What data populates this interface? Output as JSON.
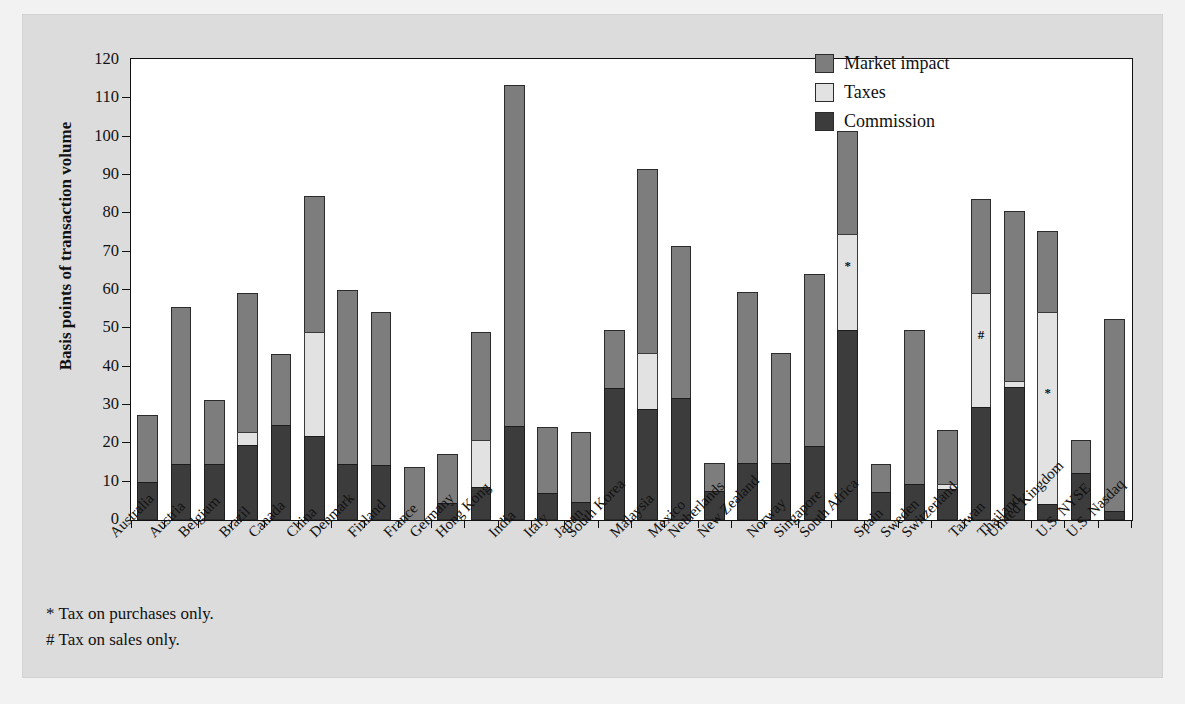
{
  "figure": {
    "background_color": "#dcdcdc",
    "plot_background_color": "#ffffff"
  },
  "legend": {
    "position": "top-right",
    "items": [
      {
        "label": "Market impact",
        "key": "market",
        "color": "#7d7d7d"
      },
      {
        "label": "Taxes",
        "key": "taxes",
        "color": "#e2e2e2"
      },
      {
        "label": "Commission",
        "key": "commission",
        "color": "#3c3c3c"
      }
    ]
  },
  "footnotes": [
    "* Tax on purchases only.",
    "# Tax on sales only."
  ],
  "chart_data": {
    "type": "bar",
    "subtype": "stacked-bar",
    "title": "",
    "xlabel": "",
    "ylabel": "Basis points of transaction volume",
    "ylim": [
      0,
      120
    ],
    "yticks": [
      0,
      10,
      20,
      30,
      40,
      50,
      60,
      70,
      80,
      90,
      100,
      110,
      120
    ],
    "grid": false,
    "legend_position": "top-right",
    "categories": [
      "Australia",
      "Austria",
      "Belgium",
      "Brazil",
      "Canada",
      "China",
      "Denmark",
      "Finland",
      "France",
      "Germany",
      "Hong Kong",
      "India",
      "Italy",
      "Japan",
      "South Korea",
      "Malaysia",
      "Mexico",
      "Netherlands",
      "New Zealand",
      "Norway",
      "Singapore",
      "South Africa",
      "Spain",
      "Sweden",
      "Switzerland",
      "Taiwan",
      "Thailand",
      "United Kingdom",
      "U.S. NYSE",
      "U.S. Nasdaq"
    ],
    "series": [
      {
        "name": "Commission",
        "color": "#3c3c3c",
        "values": [
          9.9,
          14.6,
          14.6,
          19.5,
          24.8,
          22.0,
          14.6,
          14.4,
          0.0,
          4.4,
          8.5,
          24.4,
          7.0,
          4.6,
          34.5,
          29.0,
          31.8,
          7.5,
          15.0,
          14.8,
          19.2,
          49.6,
          7.4,
          9.5,
          8.2,
          29.4,
          34.8,
          4.3,
          12.2,
          2.3
        ]
      },
      {
        "name": "Taxes",
        "color": "#e2e2e2",
        "values": [
          0.0,
          0.0,
          0.0,
          3.5,
          0.0,
          27.0,
          0.0,
          0.0,
          0.0,
          0.0,
          12.5,
          0.0,
          0.0,
          0.0,
          0.0,
          14.5,
          0.0,
          0.0,
          0.0,
          0.0,
          0.0,
          25.0,
          0.0,
          0.0,
          1.3,
          29.9,
          1.5,
          50.0,
          0.0,
          0.0
        ]
      },
      {
        "name": "Market impact",
        "color": "#7d7d7d",
        "values": [
          17.4,
          40.9,
          16.7,
          36.3,
          18.5,
          35.4,
          45.4,
          39.8,
          13.7,
          12.8,
          28.0,
          89.2,
          17.3,
          18.4,
          15.1,
          48.0,
          39.8,
          7.4,
          44.5,
          28.8,
          45.0,
          26.8,
          7.1,
          40.0,
          14.0,
          24.5,
          44.2,
          21.0,
          8.6,
          50.2
        ]
      }
    ],
    "totals": [
      27.3,
      55.5,
      31.3,
      59.3,
      43.3,
      84.4,
      60.0,
      54.2,
      13.7,
      17.2,
      49.0,
      113.6,
      24.3,
      23.0,
      49.6,
      91.5,
      71.6,
      14.9,
      59.5,
      43.6,
      64.2,
      101.4,
      14.5,
      49.5,
      23.5,
      83.8,
      80.5,
      75.3,
      20.8,
      52.5
    ],
    "annotations": [
      {
        "category": "South Africa",
        "symbol": "*",
        "at_value": 62.0
      },
      {
        "category": "Taiwan",
        "symbol": "#",
        "at_value": 44.0
      },
      {
        "category": "United Kingdom",
        "symbol": "*",
        "at_value": 29.0
      }
    ]
  }
}
